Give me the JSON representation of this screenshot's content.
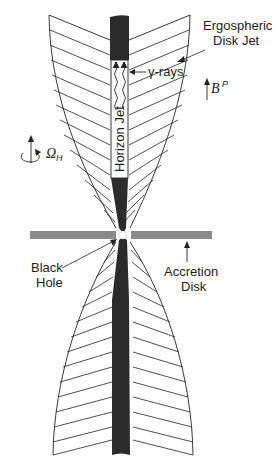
{
  "figure": {
    "type": "schematic",
    "colors": {
      "background": "#ffffff",
      "line": "#222222",
      "jet_dark": "#2b2b2b",
      "accretion_disk": "#8a8a8a",
      "black_hole": "#ffffff"
    }
  },
  "labels": {
    "ergospheric_line1": "Ergospheric",
    "ergospheric_line2": "Disk Jet",
    "gamma_rays": "γ-rays",
    "b_field": "B",
    "b_field_sup": "P",
    "omega": "Ω",
    "omega_sub": "H",
    "horizon_jet": "Horizon Jet",
    "black_hole_line1": "Black",
    "black_hole_line2": "Hole",
    "accretion_line1": "Accretion",
    "accretion_line2": "Disk"
  }
}
